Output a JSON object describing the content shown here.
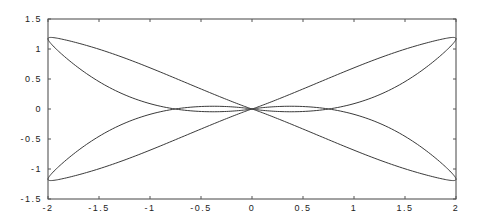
{
  "chart_data": {
    "type": "line",
    "title": "",
    "xlabel": "",
    "ylabel": "",
    "xlim": [
      -2,
      2
    ],
    "ylim": [
      -1.5,
      1.5
    ],
    "grid": false,
    "legend": null,
    "x_ticks": [
      -2,
      -1.5,
      -1,
      -0.5,
      0,
      0.5,
      1,
      1.5,
      2
    ],
    "x_tick_labels": [
      "-2",
      "-1.5",
      "-1",
      "-0.5",
      "0",
      "0.5",
      "1",
      "1.5",
      "2"
    ],
    "y_ticks": [
      -1.5,
      -1,
      -0.5,
      0,
      0.5,
      1,
      1.5
    ],
    "y_tick_labels": [
      "-1.5",
      "-1",
      "-0.5",
      "0",
      "0.5",
      "1",
      "1.5"
    ],
    "series": [
      {
        "name": "four-lobed closed curve",
        "description": "Symmetric butterfly curve with four lobes meeting at the origin; lobes reach x=±2 at y≈±1.17 and peak |y|≈1.37 near x≈±1.7",
        "key_points": [
          {
            "x": 0,
            "y": 0
          },
          {
            "x": 2,
            "y": 1.17
          },
          {
            "x": 1.7,
            "y": 1.37
          },
          {
            "x": -2,
            "y": 1.17
          },
          {
            "x": -1.7,
            "y": 1.37
          },
          {
            "x": 2,
            "y": -1.17
          },
          {
            "x": 1.7,
            "y": -1.37
          },
          {
            "x": -2,
            "y": -1.17
          },
          {
            "x": -1.7,
            "y": -1.37
          }
        ],
        "color": "#333333"
      }
    ]
  },
  "plot": {
    "left": 48,
    "top": 19,
    "right": 456,
    "bottom": 199,
    "frame_color": "#444444",
    "curve_color": "#3a3a3a"
  }
}
